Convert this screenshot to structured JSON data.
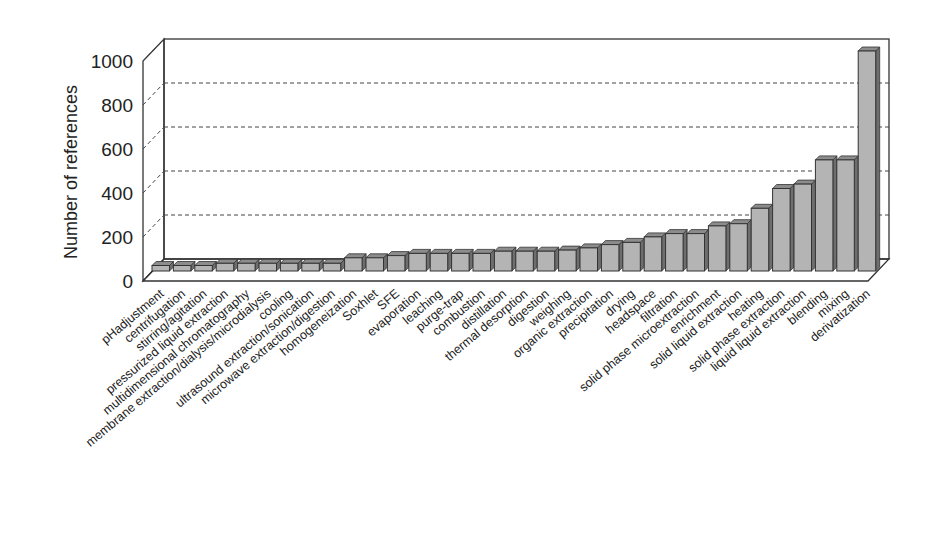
{
  "chart_data": {
    "type": "bar",
    "style": "3d-column",
    "title": "",
    "xlabel": "",
    "ylabel": "Number of references",
    "ylim": [
      0,
      1000
    ],
    "yticks": [
      0,
      200,
      400,
      600,
      800,
      1000
    ],
    "grid": true,
    "legend": null,
    "categories": [
      "pHadjustment",
      "centrifugation",
      "stirring/agitation",
      "pressurized liquid extraction",
      "multidimensional chromatography",
      "membrane extraction/dialysis/microdialysis",
      "cooling",
      "ultrasound extraction/sonication",
      "microwave extraction/digestion",
      "homogeneization",
      "Soxhlet",
      "SFE",
      "evaporation",
      "leaching",
      "purge-trap",
      "combustion",
      "distillation",
      "thermal desorption",
      "digestion",
      "weighing",
      "organic extraction",
      "precipitation",
      "drying",
      "headspace",
      "filtration",
      "solid phase microextraction",
      "enrichment",
      "solid liquid extraction",
      "heating",
      "solid phase extraction",
      "liquid liquid extraction",
      "blending",
      "mixing",
      "derivatization"
    ],
    "values": [
      25,
      25,
      25,
      35,
      35,
      35,
      35,
      35,
      35,
      60,
      60,
      70,
      80,
      80,
      80,
      80,
      90,
      90,
      90,
      95,
      105,
      120,
      130,
      155,
      170,
      170,
      205,
      215,
      285,
      375,
      395,
      505,
      505,
      1000
    ],
    "colors": {
      "bar_front": "#b4b4b4",
      "bar_side": "#6e6e6e",
      "bar_top": "#8c8c8c",
      "bar_edge": "#333333",
      "frame": "#333333",
      "grid": "#444444"
    }
  }
}
